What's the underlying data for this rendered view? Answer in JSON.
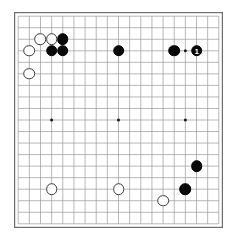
{
  "figure": {
    "kind": "go-board-diagram",
    "board_size": 19,
    "board_width_px": 209,
    "board_height_px": 216,
    "grid_color": "#9a9a9a",
    "border_color": "#6e6e6e",
    "background_color": "#ffffff",
    "black_color": "#0a0a0a",
    "white_color": "#ffffff",
    "white_outline_color": "#3c3c3c",
    "star_point_color": "#1a1a1a"
  },
  "star_points": [
    {
      "col": 3,
      "row": 3
    },
    {
      "col": 9,
      "row": 3
    },
    {
      "col": 15,
      "row": 3
    },
    {
      "col": 3,
      "row": 9
    },
    {
      "col": 9,
      "row": 9
    },
    {
      "col": 15,
      "row": 9
    },
    {
      "col": 3,
      "row": 15
    },
    {
      "col": 9,
      "row": 15
    },
    {
      "col": 15,
      "row": 15
    }
  ],
  "stones": [
    {
      "id": "w-c2-r2",
      "color": "white",
      "col": 2,
      "row": 2,
      "label": ""
    },
    {
      "id": "w-c1-r3",
      "color": "white",
      "col": 1,
      "row": 3,
      "label": ""
    },
    {
      "id": "w-c1-r5",
      "color": "white",
      "col": 1,
      "row": 5,
      "label": ""
    },
    {
      "id": "w-c3-r2",
      "color": "white",
      "col": 3,
      "row": 2,
      "label": ""
    },
    {
      "id": "b-c4-r2",
      "color": "black",
      "col": 4,
      "row": 2,
      "label": ""
    },
    {
      "id": "b-c3-r3",
      "color": "black",
      "col": 3,
      "row": 3,
      "label": ""
    },
    {
      "id": "b-c4-r3",
      "color": "black",
      "col": 4,
      "row": 3,
      "label": ""
    },
    {
      "id": "b-c9-r3",
      "color": "black",
      "col": 9,
      "row": 3,
      "label": ""
    },
    {
      "id": "b-c14-r3",
      "color": "black",
      "col": 14,
      "row": 3,
      "label": ""
    },
    {
      "id": "b-c16-r3",
      "color": "black",
      "col": 16,
      "row": 3,
      "label": "1"
    },
    {
      "id": "b-c16-r13",
      "color": "black",
      "col": 16,
      "row": 13,
      "label": ""
    },
    {
      "id": "b-c15-r15",
      "color": "black",
      "col": 15,
      "row": 15,
      "label": ""
    },
    {
      "id": "w-c13-r16",
      "color": "white",
      "col": 13,
      "row": 16,
      "label": ""
    },
    {
      "id": "w-c3-r15",
      "color": "white",
      "col": 3,
      "row": 15,
      "label": ""
    },
    {
      "id": "w-c9-r15",
      "color": "white",
      "col": 9,
      "row": 15,
      "label": ""
    }
  ]
}
